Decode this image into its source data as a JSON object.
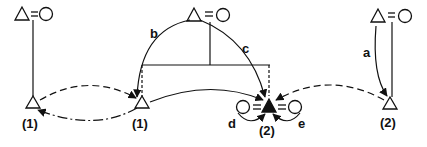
{
  "diagram": {
    "nodes": [
      {
        "id": "top-left",
        "symbol": "△=○"
      },
      {
        "id": "top-center",
        "symbol": "△=○"
      },
      {
        "id": "top-right",
        "symbol": "△=○"
      },
      {
        "id": "bottom-left",
        "symbol": "△",
        "label": "(1)"
      },
      {
        "id": "bottom-center-left",
        "symbol": "△",
        "label": "(1)"
      },
      {
        "id": "bottom-center",
        "symbol": "○=▲=○",
        "label": "(2)"
      },
      {
        "id": "bottom-right",
        "symbol": "△",
        "label": "(2)"
      }
    ],
    "labels": {
      "bottom_left": "(1)",
      "bottom_center_left": "(1)",
      "bottom_center": "(2)",
      "bottom_right": "(2)"
    },
    "arrows": {
      "a": "a",
      "b": "b",
      "c": "c",
      "d": "d",
      "e": "e"
    },
    "equals": "="
  }
}
